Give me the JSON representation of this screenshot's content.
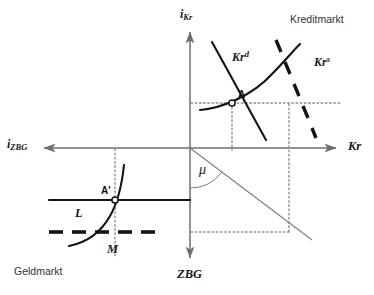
{
  "figure": {
    "background": "#ffffff",
    "ink": "#1a1a1a",
    "guide_color": "#8a8a8a",
    "width": 374,
    "height": 295
  },
  "axes": {
    "vertical_top_label": {
      "base": "i",
      "sub": "Kr"
    },
    "vertical_bottom_label": "ZBG",
    "horizontal_left_label": {
      "base": "i",
      "sub": "ZBG"
    },
    "horizontal_right_label": "Kr",
    "origin": {
      "x": 190,
      "y": 148
    },
    "vertical_extent": {
      "top": 28,
      "bottom": 262
    },
    "horizontal_extent": {
      "left": 40,
      "right": 340
    }
  },
  "quadrant_titles": {
    "upper_right": "Kreditmarkt",
    "lower_left": "Geldmarkt"
  },
  "curves": [
    {
      "name": "credit-demand",
      "label_base": "Kr",
      "label_sup": "d",
      "style": "solid",
      "quadrant": "upper-right",
      "slope": "downward"
    },
    {
      "name": "credit-supply",
      "label_base": "Kr",
      "label_sup": "s",
      "style": "solid",
      "quadrant": "upper-right",
      "slope": "upward-convex"
    },
    {
      "name": "credit-policy-shift",
      "label_base": "",
      "label_sup": "",
      "style": "thick-dashed",
      "quadrant": "upper-right",
      "slope": "steep-downward"
    },
    {
      "name": "money-supply-L",
      "label_base": "L",
      "label_sup": "",
      "style": "solid-horizontal",
      "quadrant": "lower-left",
      "slope": "flat"
    },
    {
      "name": "money-demand-M",
      "label_base": "M",
      "label_sup": "",
      "style": "solid",
      "quadrant": "lower-left",
      "slope": "upward-convex"
    },
    {
      "name": "money-policy-shift",
      "label_base": "",
      "label_sup": "",
      "style": "thick-dashed-horizontal",
      "quadrant": "lower-left",
      "slope": "flat"
    },
    {
      "name": "transmission-ray",
      "label_base": "",
      "label_sup": "",
      "style": "thin-solid",
      "quadrant": "lower-right",
      "slope": "downward"
    }
  ],
  "points": [
    {
      "name": "A",
      "label": "A",
      "x": 232,
      "y": 103,
      "marker": "open-circle"
    },
    {
      "name": "A'",
      "label": "A'",
      "x": 115,
      "y": 200,
      "marker": "open-circle"
    }
  ],
  "angle": {
    "name": "mu",
    "symbol": "μ",
    "vertex": {
      "x": 190,
      "y": 148
    },
    "between": [
      "vertical-axis-down",
      "transmission-ray"
    ]
  },
  "guides": {
    "style": "dotted",
    "lines": [
      {
        "name": "equilibrium-horizontal",
        "from": [
          190,
          103
        ],
        "to": [
          340,
          103
        ]
      },
      {
        "name": "equilibrium-vertical-A",
        "from": [
          232,
          103
        ],
        "to": [
          232,
          148
        ]
      },
      {
        "name": "shift-vertical",
        "from": [
          289,
          103
        ],
        "to": [
          289,
          232
        ]
      },
      {
        "name": "money-horizontal",
        "from": [
          190,
          200
        ],
        "to": [
          190,
          200
        ]
      },
      {
        "name": "lower-horizontal-L",
        "from": [
          115,
          200
        ],
        "to": [
          190,
          200
        ]
      },
      {
        "name": "lower-horizontal-shift",
        "from": [
          115,
          232
        ],
        "to": [
          289,
          232
        ]
      },
      {
        "name": "money-vertical",
        "from": [
          115,
          148
        ],
        "to": [
          115,
          258
        ]
      }
    ]
  }
}
